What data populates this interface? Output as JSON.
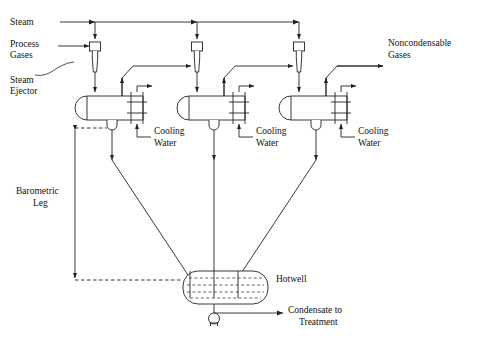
{
  "diagram": {
    "stroke_color": "#222222",
    "background": "#ffffff",
    "labels": {
      "steam": "Steam",
      "process_gases_line1": "Process",
      "process_gases_line2": "Gases",
      "steam_ejector_line1": "Steam",
      "steam_ejector_line2": "Ejector",
      "noncondensable_line1": "Noncondensable",
      "noncondensable_line2": "Gases",
      "cooling_water_line1": "Cooling",
      "cooling_water_line2": "Water",
      "barometric_leg_line1": "Barometric",
      "barometric_leg_line2": "Leg",
      "hotwell": "Hotwell",
      "condensate_line1": "Condensate to",
      "condensate_line2": "Treatment"
    },
    "stages": [
      {
        "id": 1,
        "ejector_x": 95,
        "condenser_x": 80,
        "cooling_water_label_x": 152,
        "cooling_water_label_y": 133
      },
      {
        "id": 2,
        "ejector_x": 197,
        "condenser_x": 182,
        "cooling_water_label_x": 254,
        "cooling_water_label_y": 133
      },
      {
        "id": 3,
        "ejector_x": 299,
        "condenser_x": 284,
        "cooling_water_label_x": 356,
        "cooling_water_label_y": 133
      }
    ],
    "counts": {
      "ejectors": 3,
      "condensers": 3,
      "cooling_water_labels": 3,
      "hotwell": 1,
      "pump": 1
    }
  }
}
